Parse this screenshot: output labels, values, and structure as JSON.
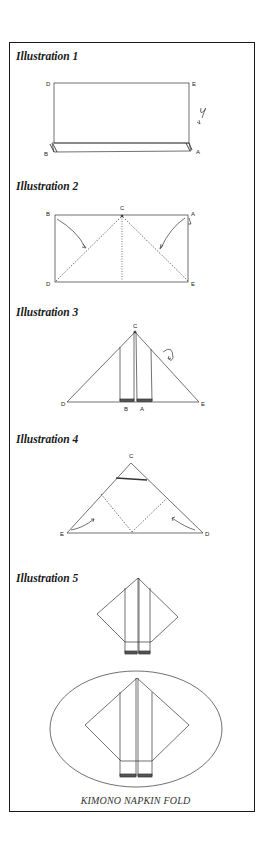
{
  "illustrations": [
    {
      "title": "Illustration 1",
      "labels": {
        "top_left": "D",
        "top_right": "E",
        "bottom_left": "B",
        "bottom_right": "A"
      }
    },
    {
      "title": "Illustration 2",
      "labels": {
        "top_left": "B",
        "top_center": "C",
        "top_right": "A",
        "bottom_left": "D",
        "bottom_right": "E"
      }
    },
    {
      "title": "Illustration 3",
      "labels": {
        "apex": "C",
        "left": "D",
        "right": "E",
        "bottom_center_left": "B",
        "bottom_center_right": "A"
      }
    },
    {
      "title": "Illustration 4",
      "labels": {
        "apex": "C",
        "left": "E",
        "right": "D"
      }
    },
    {
      "title": "Illustration 5"
    }
  ],
  "caption": "KIMONO NAPKIN FOLD"
}
